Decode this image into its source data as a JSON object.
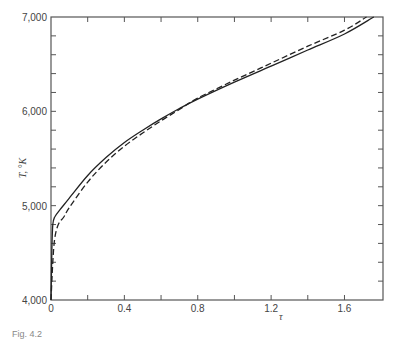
{
  "chart_data": {
    "type": "line",
    "title": "",
    "xlabel": "τ",
    "ylabel": "T, °K",
    "xlim": [
      0,
      1.81
    ],
    "ylim": [
      4000,
      7000
    ],
    "x_ticks": [
      0,
      0.4,
      0.8,
      1.2,
      1.6
    ],
    "x_tick_labels": [
      "0",
      "0.4",
      "0.8",
      "1.2",
      "1.6"
    ],
    "x_minor_ticks": [
      0.2,
      0.6,
      1.0,
      1.4
    ],
    "y_ticks": [
      4000,
      5000,
      6000,
      7000
    ],
    "y_tick_labels": [
      "4,000",
      "5,000",
      "6,000",
      "7,000"
    ],
    "y_minor_ticks": [
      4200,
      4400,
      4600,
      4800,
      5200,
      5400,
      5600,
      5800,
      6200,
      6400,
      6600,
      6800
    ],
    "grid": false,
    "legend": null,
    "series": [
      {
        "name": "solid",
        "style": "solid",
        "x": [
          0.0,
          0.005,
          0.01,
          0.02,
          0.05,
          0.1,
          0.2,
          0.3,
          0.4,
          0.5,
          0.6,
          0.7,
          0.8,
          1.0,
          1.2,
          1.4,
          1.6,
          1.76
        ],
        "y": [
          4000,
          4550,
          4800,
          4880,
          4960,
          5080,
          5320,
          5510,
          5670,
          5800,
          5920,
          6030,
          6130,
          6310,
          6480,
          6650,
          6820,
          7000
        ]
      },
      {
        "name": "dashed",
        "style": "dashed",
        "x": [
          0.0,
          0.01,
          0.02,
          0.04,
          0.07,
          0.1,
          0.2,
          0.3,
          0.4,
          0.5,
          0.6,
          0.7,
          0.8,
          1.0,
          1.2,
          1.4,
          1.6,
          1.72
        ],
        "y": [
          4000,
          4400,
          4650,
          4800,
          4880,
          4980,
          5250,
          5460,
          5630,
          5770,
          5900,
          6020,
          6140,
          6330,
          6510,
          6690,
          6860,
          7000
        ]
      }
    ]
  },
  "caption": "Fig. 4.2"
}
